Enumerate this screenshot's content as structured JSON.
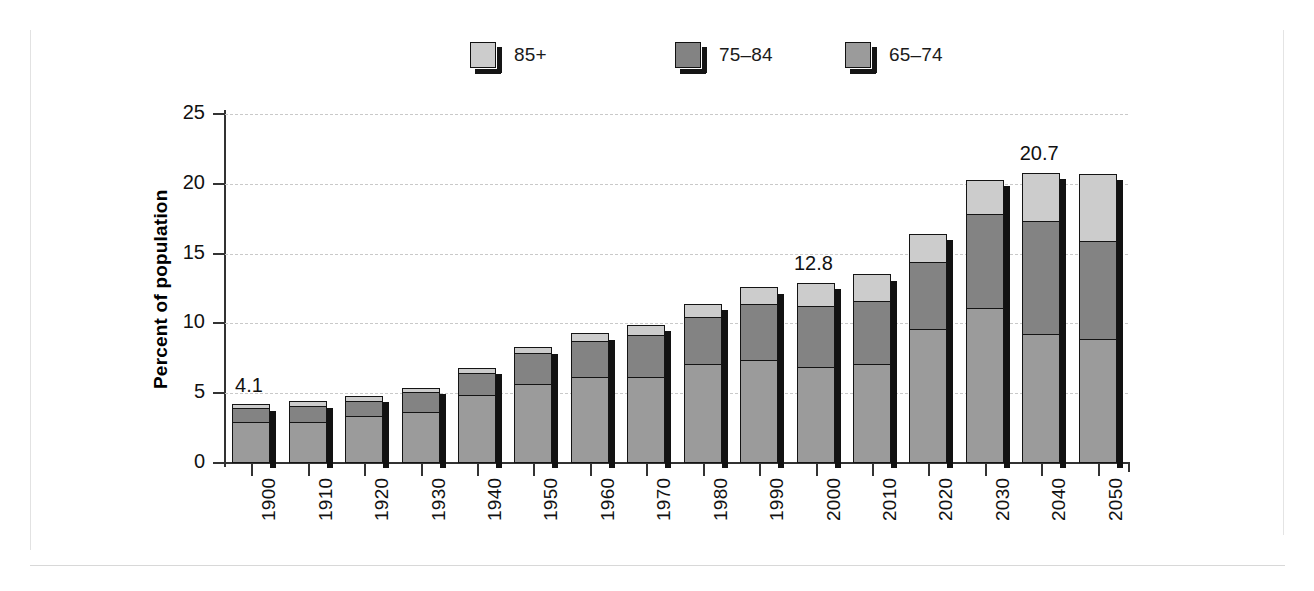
{
  "decor": {
    "left_rule": "vertical-rule",
    "bottom_rule": "horizontal-rule",
    "right_rule": "vertical-rule"
  },
  "legend": {
    "position": "top-center",
    "items": [
      {
        "label": "85+",
        "color": "#cccccc"
      },
      {
        "label": "75–84",
        "color": "#838383"
      },
      {
        "label": "65–74",
        "color": "#9b9b9b"
      }
    ]
  },
  "axes": {
    "ylabel": "Percent of population",
    "xlabel": "Year",
    "yticks": [
      "0",
      "5",
      "10",
      "15",
      "20",
      "25"
    ]
  },
  "chart_data": {
    "type": "bar",
    "title": "",
    "subtitle": "",
    "xlabel": "Year",
    "ylabel": "Percent of population",
    "ylim": [
      0,
      25
    ],
    "ytick_values": [
      0,
      5,
      10,
      15,
      20,
      25
    ],
    "grid": true,
    "stacked": true,
    "legend_position": "top-center",
    "categories": [
      "1900",
      "1910",
      "1920",
      "1930",
      "1940",
      "1950",
      "1960",
      "1970",
      "1980",
      "1990",
      "2000",
      "2010",
      "2020",
      "2030",
      "2040",
      "2050"
    ],
    "series": [
      {
        "name": "65–74",
        "color": "#9b9b9b",
        "values": [
          2.9,
          2.9,
          3.3,
          3.6,
          4.8,
          5.6,
          6.1,
          6.1,
          7.0,
          7.3,
          6.8,
          7.0,
          9.5,
          11.0,
          9.2,
          8.8
        ]
      },
      {
        "name": "75–84",
        "color": "#838383",
        "values": [
          1.0,
          1.1,
          1.1,
          1.4,
          1.6,
          2.2,
          2.6,
          3.0,
          3.4,
          4.0,
          4.4,
          4.5,
          4.8,
          6.8,
          8.1,
          7.0
        ]
      },
      {
        "name": "85+",
        "color": "#cccccc",
        "values": [
          0.2,
          0.3,
          0.3,
          0.3,
          0.3,
          0.4,
          0.5,
          0.7,
          0.9,
          1.2,
          1.6,
          1.9,
          2.0,
          2.4,
          3.4,
          4.8
        ]
      }
    ],
    "totals": [
      4.1,
      4.3,
      4.7,
      5.3,
      6.7,
      8.2,
      9.2,
      9.8,
      11.3,
      12.5,
      12.8,
      13.4,
      16.3,
      20.2,
      20.7,
      20.6
    ],
    "data_labels": [
      {
        "category": "1900",
        "text": "4.1"
      },
      {
        "category": "2000",
        "text": "12.8"
      },
      {
        "category": "2040",
        "text": "20.7"
      }
    ]
  }
}
